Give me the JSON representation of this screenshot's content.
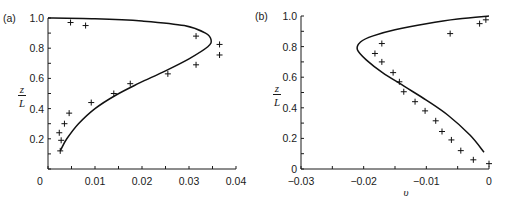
{
  "chart_data": [
    {
      "type": "line",
      "panel_label": "(a)",
      "title": "",
      "xlabel": "",
      "ylabel": "z/L",
      "ylabel_num": "z",
      "ylabel_den": "L",
      "xlim": [
        0,
        0.04
      ],
      "ylim": [
        0,
        1.0
      ],
      "x_ticks": [
        0,
        0.01,
        0.02,
        0.03,
        0.04
      ],
      "x_tick_labels": [
        "0",
        "0.01",
        "0.02",
        "0.03",
        "0.04"
      ],
      "y_ticks": [
        0.2,
        0.4,
        0.6,
        0.8,
        1.0
      ],
      "y_tick_labels": [
        "0.2",
        "0.4",
        "0.6",
        "0.8",
        "1.0"
      ],
      "grid": false,
      "series": [
        {
          "name": "theory",
          "style": "solid-line",
          "points": [
            [
              0.0026,
              0.12
            ],
            [
              0.004,
              0.2
            ],
            [
              0.0065,
              0.3
            ],
            [
              0.01,
              0.4
            ],
            [
              0.0145,
              0.49
            ],
            [
              0.0195,
              0.57
            ],
            [
              0.025,
              0.65
            ],
            [
              0.03,
              0.73
            ],
            [
              0.034,
              0.81
            ],
            [
              0.0347,
              0.855
            ],
            [
              0.0335,
              0.9
            ],
            [
              0.029,
              0.95
            ],
            [
              0.02,
              0.98
            ],
            [
              0.01,
              0.995
            ],
            [
              0.0,
              1.0
            ]
          ]
        },
        {
          "name": "data",
          "style": "plus-marker",
          "points": [
            [
              0.0026,
              0.12
            ],
            [
              0.0028,
              0.19
            ],
            [
              0.0024,
              0.24
            ],
            [
              0.0035,
              0.3
            ],
            [
              0.0045,
              0.37
            ],
            [
              0.0092,
              0.44
            ],
            [
              0.014,
              0.5
            ],
            [
              0.0175,
              0.565
            ],
            [
              0.0255,
              0.63
            ],
            [
              0.0315,
              0.69
            ],
            [
              0.0365,
              0.755
            ],
            [
              0.0365,
              0.825
            ],
            [
              0.0315,
              0.88
            ],
            [
              0.008,
              0.95
            ],
            [
              0.0048,
              0.97
            ]
          ]
        }
      ]
    },
    {
      "type": "line",
      "panel_label": "(b)",
      "title": "",
      "xlabel": "υ",
      "ylabel": "z/L",
      "ylabel_num": "z",
      "ylabel_den": "L",
      "xlim": [
        -0.03,
        0
      ],
      "ylim": [
        0,
        1.0
      ],
      "x_ticks": [
        -0.03,
        -0.02,
        -0.01,
        0
      ],
      "x_tick_labels": [
        "-0.03",
        "-0.02",
        "-0.01",
        "0"
      ],
      "y_ticks": [
        0,
        0.2,
        0.4,
        0.6,
        0.8,
        1.0
      ],
      "y_tick_labels": [
        "0",
        "0.2",
        "0.4",
        "0.6",
        "0.8",
        "1.0"
      ],
      "grid": false,
      "series": [
        {
          "name": "theory",
          "style": "solid-line",
          "points": [
            [
              -0.0008,
              0.11
            ],
            [
              -0.003,
              0.22
            ],
            [
              -0.0065,
              0.35
            ],
            [
              -0.01,
              0.45
            ],
            [
              -0.0135,
              0.54
            ],
            [
              -0.017,
              0.63
            ],
            [
              -0.0195,
              0.71
            ],
            [
              -0.021,
              0.78
            ],
            [
              -0.0205,
              0.83
            ],
            [
              -0.0185,
              0.87
            ],
            [
              -0.015,
              0.91
            ],
            [
              -0.01,
              0.95
            ],
            [
              -0.005,
              0.98
            ],
            [
              0.0,
              1.0
            ]
          ]
        },
        {
          "name": "data",
          "style": "plus-marker",
          "points": [
            [
              0.0,
              0.035
            ],
            [
              -0.0025,
              0.06
            ],
            [
              -0.0045,
              0.12
            ],
            [
              -0.006,
              0.19
            ],
            [
              -0.0075,
              0.245
            ],
            [
              -0.0085,
              0.315
            ],
            [
              -0.0102,
              0.38
            ],
            [
              -0.0118,
              0.44
            ],
            [
              -0.0136,
              0.505
            ],
            [
              -0.0143,
              0.57
            ],
            [
              -0.0153,
              0.63
            ],
            [
              -0.0171,
              0.7
            ],
            [
              -0.0182,
              0.755
            ],
            [
              -0.0171,
              0.82
            ],
            [
              -0.0062,
              0.885
            ],
            [
              -0.0015,
              0.95
            ],
            [
              -0.0005,
              0.975
            ]
          ]
        }
      ]
    }
  ]
}
